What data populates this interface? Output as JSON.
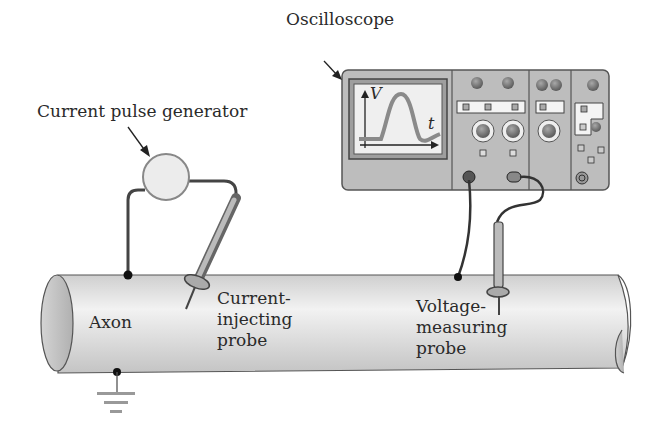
{
  "labels": {
    "oscilloscope": "Oscilloscope",
    "pulse_generator": "Current pulse generator",
    "axon": "Axon",
    "current_probe": "Current-\ninjecting\nprobe",
    "voltage_probe": "Voltage-\nmeasuring\nprobe",
    "screen_v": "V",
    "screen_t": "t"
  },
  "colors": {
    "axon_fill": "#d8d8d8",
    "scope_body": "#bdbdbd",
    "trace": "#8a8a8a",
    "wire": "#333333"
  }
}
